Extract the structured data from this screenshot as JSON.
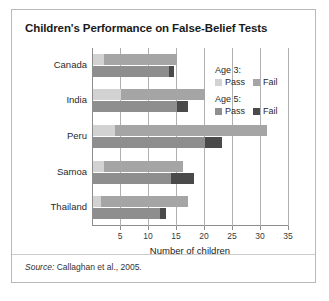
{
  "figure": {
    "title": "Children's Performance on False-Belief Tests",
    "source_label": "Source:",
    "source_text": "Callaghan et al., 2005."
  },
  "legend": {
    "groups": [
      {
        "heading": "Age 3:",
        "items": [
          {
            "label": "Pass",
            "color": "#d2d2d2"
          },
          {
            "label": "Fail",
            "color": "#a5a5a5"
          }
        ]
      },
      {
        "heading": "Age 5:",
        "items": [
          {
            "label": "Pass",
            "color": "#8e8e8e"
          },
          {
            "label": "Fail",
            "color": "#4a4a4a"
          }
        ]
      }
    ]
  },
  "chart_data": {
    "type": "bar",
    "orientation": "horizontal",
    "stacked": true,
    "title": "Children's Performance on False-Belief Tests",
    "xlabel": "Number of children",
    "ylabel": "",
    "xlim": [
      0,
      35
    ],
    "xticks": [
      5,
      10,
      15,
      20,
      25,
      30,
      35
    ],
    "grid": true,
    "legend_position": "inside-right",
    "categories": [
      "Canada",
      "India",
      "Peru",
      "Samoa",
      "Thailand"
    ],
    "series": [
      {
        "name": "Age 3: Pass",
        "color": "#d2d2d2",
        "values": [
          2,
          5,
          4,
          2,
          1.5
        ]
      },
      {
        "name": "Age 3: Fail",
        "color": "#a5a5a5",
        "values": [
          13,
          15,
          27,
          14,
          15.5
        ]
      },
      {
        "name": "Age 5: Pass",
        "color": "#8e8e8e",
        "values": [
          13.5,
          15,
          20,
          14,
          12
        ]
      },
      {
        "name": "Age 5: Fail",
        "color": "#4a4a4a",
        "values": [
          1,
          2,
          3,
          4,
          1
        ]
      }
    ],
    "totals": {
      "age3": [
        15,
        20,
        31,
        16,
        17
      ],
      "age5": [
        14.5,
        17,
        23,
        18,
        13
      ]
    }
  }
}
